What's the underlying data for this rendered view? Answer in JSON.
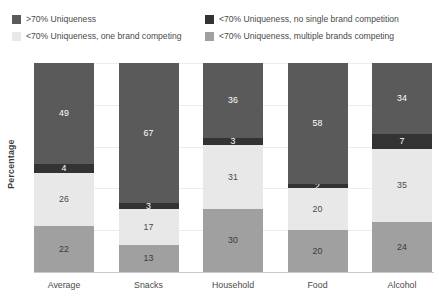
{
  "legend": {
    "items": [
      {
        "label": ">70% Uniqueness",
        "color": "#5a5a5a",
        "swatch": "legend-swatch-high-uniqueness"
      },
      {
        "label": "<70% Uniqueness, no single brand competition",
        "color": "#333333",
        "swatch": "legend-swatch-no-single-brand"
      },
      {
        "label": "<70% Uniqueness, one brand competing",
        "color": "#e8e8e8",
        "swatch": "legend-swatch-one-brand"
      },
      {
        "label": "<70% Uniqueness, multiple brands competing",
        "color": "#a0a0a0",
        "swatch": "legend-swatch-multiple-brands"
      }
    ]
  },
  "chart_data": {
    "type": "bar",
    "stacked": true,
    "title": "",
    "xlabel": "",
    "ylabel": "Percentage",
    "ylim": [
      0,
      100
    ],
    "grid": true,
    "legend_position": "top",
    "categories": [
      "Average",
      "Snacks",
      "Household",
      "Food",
      "Alcohol"
    ],
    "series": [
      {
        "name": ">70% Uniqueness",
        "color": "#5a5a5a",
        "label_color": "#ffffff",
        "values": [
          49,
          67,
          36,
          58,
          34
        ]
      },
      {
        "name": "<70% Uniqueness, no single brand competition",
        "color": "#333333",
        "label_color": "#ffffff",
        "values": [
          4,
          3,
          3,
          2,
          7
        ]
      },
      {
        "name": "<70% Uniqueness, one brand competing",
        "color": "#e8e8e8",
        "label_color": "#4a4a4a",
        "values": [
          26,
          17,
          31,
          20,
          35
        ]
      },
      {
        "name": "<70% Uniqueness, multiple brands competing",
        "color": "#a0a0a0",
        "label_color": "#3a3a3a",
        "values": [
          22,
          13,
          30,
          20,
          24
        ]
      }
    ],
    "gridlines": [
      20,
      40,
      60,
      80,
      100
    ]
  }
}
